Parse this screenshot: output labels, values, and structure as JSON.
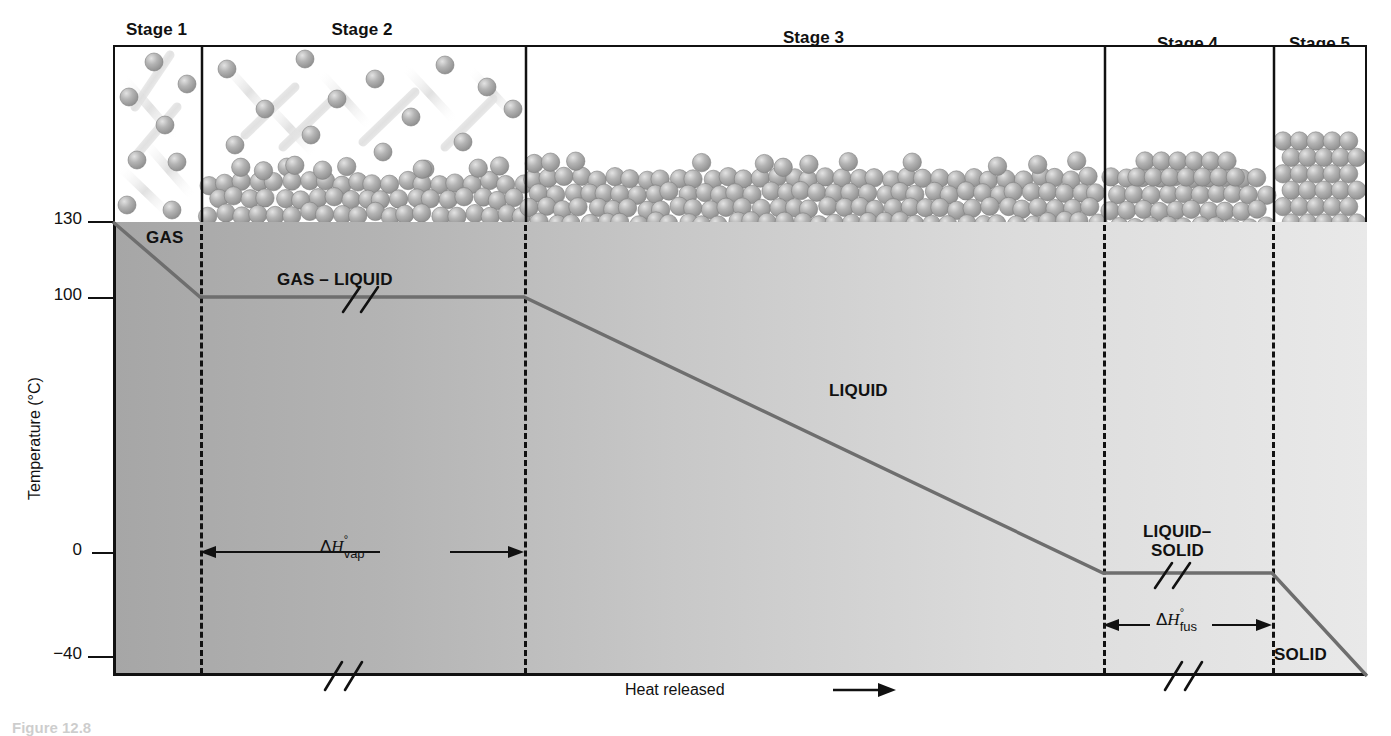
{
  "figure": {
    "caption": "Figure 12.8",
    "top_header": "",
    "ylabel": "Temperature (°C)",
    "xlabel": "Heat released",
    "xlabel_arrow": "⟶"
  },
  "stages": [
    {
      "id": "stage-1",
      "label": "Stage 1",
      "x0": 113,
      "x1": 200,
      "state": "gas"
    },
    {
      "id": "stage-2",
      "label": "Stage 2",
      "x0": 200,
      "x1": 524,
      "state": "gas-liquid"
    },
    {
      "id": "stage-3",
      "label": "Stage 3",
      "x0": 524,
      "x1": 1103,
      "state": "liquid"
    },
    {
      "id": "stage-4",
      "label": "Stage 4",
      "x0": 1103,
      "x1": 1272,
      "state": "liquid-solid"
    },
    {
      "id": "stage-5",
      "label": "Stage 5",
      "x0": 1272,
      "x1": 1367,
      "state": "solid"
    }
  ],
  "phase_labels": [
    {
      "id": "gas",
      "text": "GAS"
    },
    {
      "id": "gas-liquid",
      "text": "GAS – LIQUID"
    },
    {
      "id": "liquid",
      "text": "LIQUID"
    },
    {
      "id": "liquid-solid-1",
      "text": "LIQUID–"
    },
    {
      "id": "liquid-solid-2",
      "text": "SOLID"
    },
    {
      "id": "solid",
      "text": "SOLID"
    }
  ],
  "enthalpy_labels": [
    {
      "id": "dh-vap",
      "delta": "Δ",
      "h": "H",
      "degree": "°",
      "subscript": "vap"
    },
    {
      "id": "dh-fus",
      "delta": "Δ",
      "h": "H",
      "degree": "°",
      "subscript": "fus"
    }
  ],
  "chart_data": {
    "type": "line",
    "title": "",
    "xlabel": "Heat released",
    "ylabel": "Temperature (°C)",
    "ylim": [
      -40,
      130
    ],
    "yticks": [
      130,
      100,
      0,
      -40
    ],
    "ytick_labels": [
      "130",
      "100",
      "0",
      "−40"
    ],
    "grid": false,
    "legend": "none",
    "axis_breaks": [
      "x-axis break in Stage 2",
      "x-axis break in Stage 4",
      "plateau break in GAS – LIQUID",
      "plateau break in LIQUID–SOLID"
    ],
    "series": [
      {
        "name": "cooling curve",
        "color": "#6e6e6e",
        "points": [
          {
            "stage": 1,
            "x_px": 113,
            "temperature": 130,
            "phase": "GAS"
          },
          {
            "stage": 1,
            "x_px": 200,
            "temperature": 100,
            "phase": "GAS"
          },
          {
            "stage": 2,
            "x_px": 524,
            "temperature": 100,
            "phase": "GAS – LIQUID"
          },
          {
            "stage": 3,
            "x_px": 1103,
            "temperature": -8,
            "phase": "LIQUID"
          },
          {
            "stage": 4,
            "x_px": 1272,
            "temperature": -8,
            "phase": "LIQUID–SOLID"
          },
          {
            "stage": 5,
            "x_px": 1367,
            "temperature": -40,
            "phase": "SOLID"
          }
        ]
      }
    ],
    "annotations": [
      {
        "id": "dh-vap",
        "text": "ΔH°vap",
        "from_stage": 2,
        "from_x_px": 200,
        "to_x_px": 524,
        "temperature": 0
      },
      {
        "id": "dh-fus",
        "text": "ΔH°fus",
        "from_stage": 4,
        "from_x_px": 1103,
        "to_x_px": 1272,
        "temperature": -22
      }
    ]
  },
  "colors": {
    "curve": "#6e6e6e",
    "axis": "#111111",
    "fill_left": "#a8a8a8",
    "fill_right": "#e6e6e6",
    "particle": "#a6a6a6",
    "particle_light": "#cfcfcf"
  }
}
